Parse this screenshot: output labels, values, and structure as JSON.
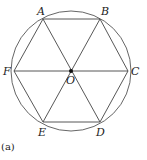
{
  "figure": {
    "caption": "(a)",
    "center": {
      "x": 71,
      "y": 71
    },
    "circle_radius": 60,
    "hexagon_radius": 57,
    "stroke_color": "#444444",
    "vertices": [
      {
        "name": "A",
        "x": 43,
        "y": 19
      },
      {
        "name": "B",
        "x": 100,
        "y": 19
      },
      {
        "name": "C",
        "x": 128,
        "y": 71
      },
      {
        "name": "D",
        "x": 100,
        "y": 122
      },
      {
        "name": "E",
        "x": 43,
        "y": 122
      },
      {
        "name": "F",
        "x": 14,
        "y": 71
      }
    ],
    "center_label": "O",
    "labels": {
      "A": "A",
      "B": "B",
      "C": "C",
      "D": "D",
      "E": "E",
      "F": "F",
      "O": "O"
    }
  }
}
